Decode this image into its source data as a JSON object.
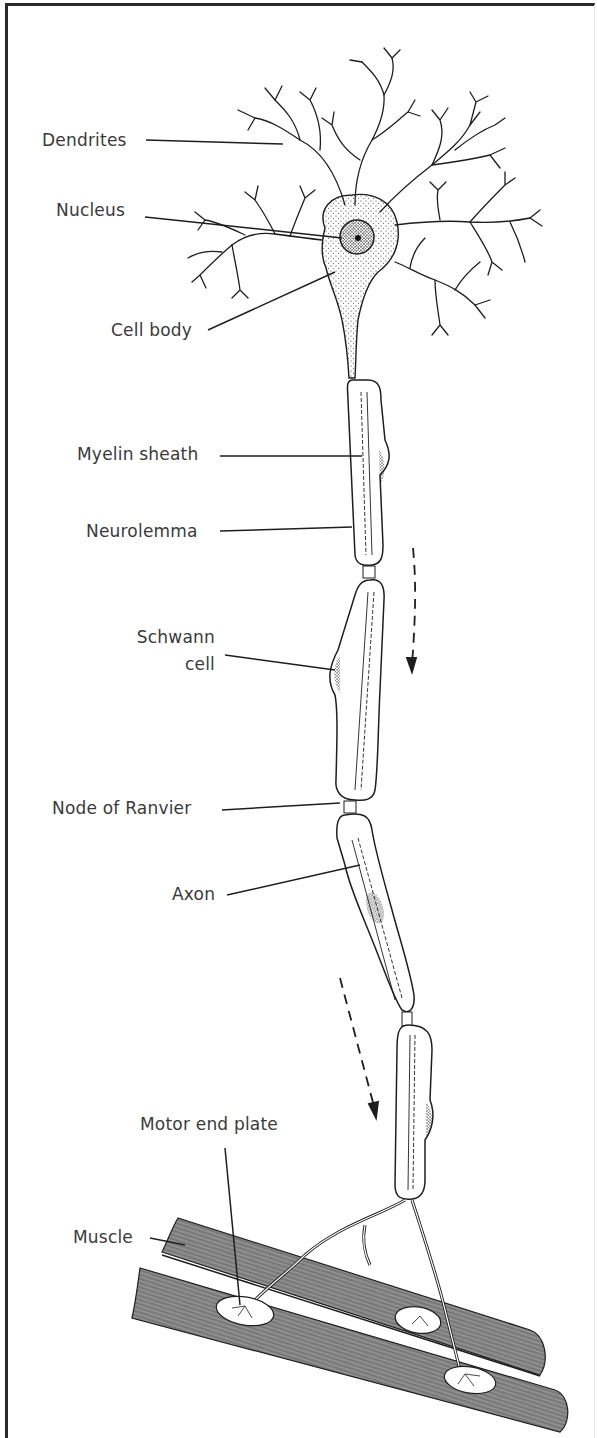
{
  "figure": {
    "labels": {
      "dendrites": "Dendrites",
      "nucleus": "Nucleus",
      "cell_body": "Cell body",
      "myelin_sheath": "Myelin sheath",
      "neurolemma": "Neurolemma",
      "schwann_line1": "Schwann",
      "schwann_line2": "cell",
      "node_of_ranvier": "Node of Ranvier",
      "axon": "Axon",
      "motor_end_plate": "Motor end plate",
      "muscle": "Muscle"
    },
    "arrows": [
      {
        "name": "impulse-direction-arrow-upper",
        "style": "dashed",
        "direction": "down"
      },
      {
        "name": "impulse-direction-arrow-lower",
        "style": "dashed",
        "direction": "down"
      }
    ],
    "colors": {
      "ink": "#1e1e1e",
      "label_text": "#3a3a3a",
      "muscle_fill": "#8f8f8f",
      "background": "#ffffff"
    }
  }
}
